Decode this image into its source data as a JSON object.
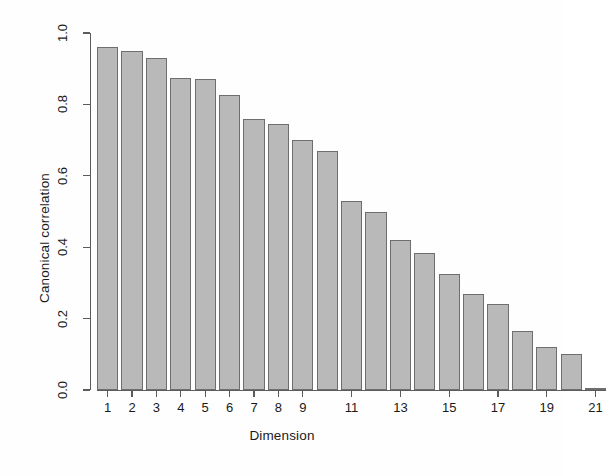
{
  "chart_data": {
    "type": "bar",
    "title": "",
    "xlabel": "Dimension",
    "ylabel": "Canonical correlation",
    "categories": [
      1,
      2,
      3,
      4,
      5,
      6,
      7,
      8,
      9,
      10,
      11,
      12,
      13,
      14,
      15,
      16,
      17,
      18,
      19,
      20,
      21
    ],
    "values": [
      0.96,
      0.95,
      0.93,
      0.875,
      0.87,
      0.825,
      0.76,
      0.745,
      0.7,
      0.67,
      0.53,
      0.5,
      0.42,
      0.385,
      0.325,
      0.27,
      0.24,
      0.165,
      0.12,
      0.1,
      0.005
    ],
    "ylim": [
      0.0,
      1.0
    ],
    "xtick_labels": [
      "1",
      "2",
      "3",
      "4",
      "5",
      "6",
      "7",
      "8",
      "9",
      "",
      "11",
      "",
      "13",
      "",
      "15",
      "",
      "17",
      "",
      "19",
      "",
      "21"
    ],
    "ytick_labels": [
      "0.0",
      "0.2",
      "0.4",
      "0.6",
      "0.8",
      "1.0"
    ],
    "ytick_values": [
      0.0,
      0.2,
      0.4,
      0.6,
      0.8,
      1.0
    ],
    "grid": false,
    "legend": null,
    "bar_color": "#b9b9b9",
    "bar_border_color": "#6e6e6e",
    "axis_color": "#5b5b5b"
  }
}
